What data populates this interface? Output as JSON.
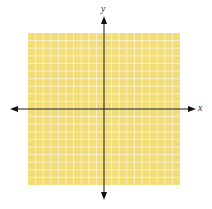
{
  "diagram": {
    "type": "coordinate-plane",
    "grid": {
      "cells_x": 20,
      "cells_y": 20,
      "fill_color": "#f3dd78",
      "line_color": "#fbf3cf"
    },
    "axes": {
      "color": "#111111",
      "x_label": "x",
      "y_label": "y",
      "arrows": "both-ends"
    }
  }
}
